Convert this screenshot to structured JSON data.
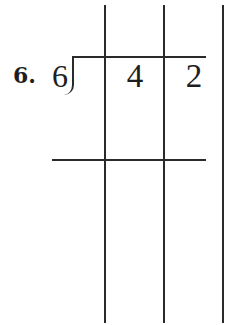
{
  "problem": {
    "number_label": "6.",
    "divisor": "6",
    "dividend_digits": [
      "4",
      "2"
    ]
  },
  "grid": {
    "line_color": "#2a2a2a",
    "vertical_lines_x": [
      105,
      164,
      223
    ],
    "division_bar_y": 57,
    "subtraction_line_y": 160
  }
}
